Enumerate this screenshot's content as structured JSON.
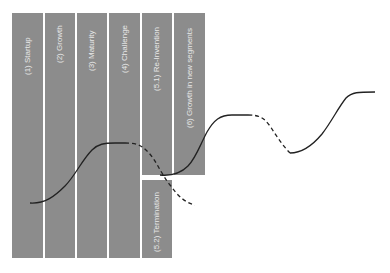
{
  "diagram": {
    "type": "lifecycle-stages",
    "stages": [
      {
        "label": "(1) Startup"
      },
      {
        "label": "(2) Growth"
      },
      {
        "label": "(3) Maturity"
      },
      {
        "label": "(4) Challenge"
      },
      {
        "label": "(5.1) Re-Invention"
      },
      {
        "label": "(6) Growth in new segments"
      },
      {
        "label": "(5.2) Termination"
      }
    ],
    "colors": {
      "stage_fill": "#8c8c8c",
      "label_text": "#e8e8e8",
      "curve": "#222222"
    }
  }
}
